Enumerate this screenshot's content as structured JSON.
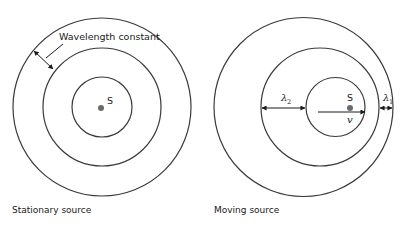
{
  "diagrams": [
    {
      "id": "stationary",
      "caption": "Stationary source",
      "source_label": "S",
      "annotation": "Wavelength constant",
      "rings": [
        {
          "cx": 102,
          "cy": 107,
          "r": 30
        },
        {
          "cx": 102,
          "cy": 107,
          "r": 59
        },
        {
          "cx": 102,
          "cy": 107,
          "r": 89
        }
      ],
      "source_dot": {
        "cx": 101,
        "cy": 108
      }
    },
    {
      "id": "moving",
      "caption": "Moving source",
      "source_label": "S",
      "velocity_label": "v",
      "lambda_behind": {
        "symbol": "λ",
        "subscript": "2"
      },
      "lambda_ahead": {
        "symbol": "λ",
        "subscript": "1"
      },
      "rings": [
        {
          "cx": 335.5,
          "cy": 107,
          "r": 29.5
        },
        {
          "cx": 320,
          "cy": 107,
          "r": 59
        },
        {
          "cx": 303.5,
          "cy": 107,
          "r": 89.5
        }
      ],
      "source_dot": {
        "cx": 350,
        "cy": 108
      }
    }
  ],
  "colors": {
    "line": "#3a3a3a",
    "dot": "#6b6b6b",
    "text": "#1a1a1a",
    "background": "#ffffff"
  }
}
